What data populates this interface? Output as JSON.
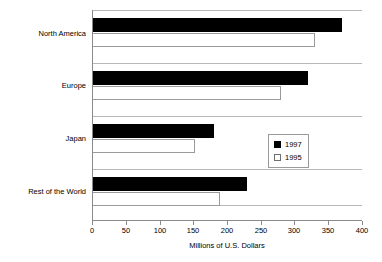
{
  "chart_data": {
    "type": "bar",
    "orientation": "horizontal",
    "title": "",
    "xlabel": "Millions of U.S. Dollars",
    "ylabel": "",
    "xlim": [
      0,
      400
    ],
    "xticks": [
      0,
      50,
      100,
      150,
      200,
      250,
      300,
      350,
      400
    ],
    "grid": false,
    "legend_position": "center-right",
    "categories": [
      "North America",
      "Europe",
      "Japan",
      "Rest of the World"
    ],
    "series": [
      {
        "name": "1997",
        "color": "#000000",
        "values": [
          370,
          320,
          180,
          230
        ]
      },
      {
        "name": "1995",
        "color": "#ffffff",
        "values": [
          330,
          280,
          153,
          190
        ]
      }
    ]
  },
  "legend": {
    "items": [
      {
        "label": "1997",
        "swatch": "filled-square"
      },
      {
        "label": "1995",
        "swatch": "open-square"
      }
    ]
  },
  "axis": {
    "x_title": "Millions of U.S. Dollars",
    "tick_labels": [
      "0",
      "50",
      "100",
      "150",
      "200",
      "250",
      "300",
      "350",
      "400"
    ]
  },
  "categories": {
    "labels": [
      "North America",
      "Europe",
      "Japan",
      "Rest of the World"
    ]
  }
}
